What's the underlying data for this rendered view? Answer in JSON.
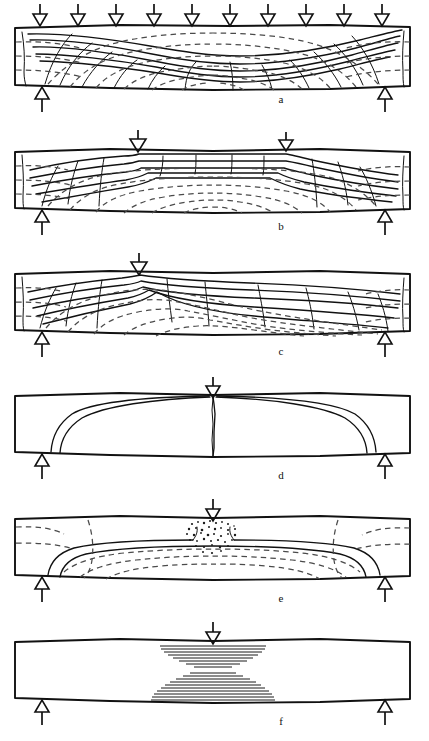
{
  "figure": {
    "width": 429,
    "height": 741,
    "background_color": "#ffffff",
    "line_color": "#111111",
    "dashed_line_color": "#4a4a4a",
    "beam_left": 15,
    "beam_right": 410,
    "panel_height": 58,
    "label_x": 281
  },
  "legend": {
    "solid_line_meaning": "principal compressive stress trajectory / crack line",
    "dashed_line_meaning": "principal tensile stress trajectory",
    "down_arrow_meaning": "applied load",
    "up_arrow_meaning": "support reaction"
  },
  "panels": [
    {
      "id": "a",
      "label": "a",
      "label_x": 281,
      "label_y": 100,
      "beam_top": 27,
      "beam_bottom": 85,
      "loading": "uniformly distributed load",
      "load_arrow_count": 10,
      "load_arrow_x": [
        40,
        78,
        116,
        154,
        192,
        230,
        268,
        306,
        344,
        382
      ],
      "support_x": [
        42,
        385
      ],
      "pattern": "symmetric nested arch trajectories with fine transverse crack ticks"
    },
    {
      "id": "b",
      "label": "b",
      "label_x": 281,
      "label_y": 227,
      "beam_top": 150,
      "beam_bottom": 208,
      "loading": "two point loads",
      "load_arrow_count": 2,
      "load_arrow_x": [
        138,
        286
      ],
      "support_x": [
        42,
        385
      ],
      "pattern": "constant moment region with flat parallel trajectories between loads"
    },
    {
      "id": "c",
      "label": "c",
      "label_x": 281,
      "label_y": 352,
      "beam_top": 272,
      "beam_bottom": 330,
      "loading": "single off-centre point load",
      "load_arrow_count": 1,
      "load_arrow_x": [
        139
      ],
      "support_x": [
        42,
        385
      ],
      "pattern": "asymmetric trajectories converging on the load point"
    },
    {
      "id": "d",
      "label": "d",
      "label_x": 281,
      "label_y": 476,
      "beam_top": 394,
      "beam_bottom": 452,
      "loading": "single central point load",
      "load_arrow_count": 1,
      "load_arrow_x": [
        213
      ],
      "support_x": [
        42,
        385
      ],
      "pattern": "two inclined shear cracks from supports to load plus vertical flexural crack"
    },
    {
      "id": "e",
      "label": "e",
      "label_x": 281,
      "label_y": 599,
      "beam_top": 517,
      "beam_bottom": 575,
      "loading": "single central point load",
      "load_arrow_count": 1,
      "load_arrow_x": [
        213
      ],
      "support_x": [
        42,
        385
      ],
      "pattern": "shear compression failure with concrete crushing zone under the load",
      "crush_zone": {
        "cx": 213,
        "cy": 537,
        "rx": 26,
        "ry": 19
      }
    },
    {
      "id": "f",
      "label": "f",
      "label_x": 281,
      "label_y": 722,
      "beam_top": 640,
      "beam_bottom": 698,
      "loading": "single central point load",
      "load_arrow_count": 1,
      "load_arrow_x": [
        213
      ],
      "support_x": [
        42,
        385
      ],
      "pattern": "flexural compression crushing zone at top and tension zone at bottom",
      "hatch_zones": [
        {
          "position": "top",
          "cx": 213,
          "y_start": 648,
          "lines": 8,
          "half_width_top": 64,
          "half_width_bottom": 24
        },
        {
          "position": "bottom",
          "cx": 213,
          "y_start": 672,
          "lines": 9,
          "half_width_top": 24,
          "half_width_bottom": 64
        }
      ]
    }
  ]
}
